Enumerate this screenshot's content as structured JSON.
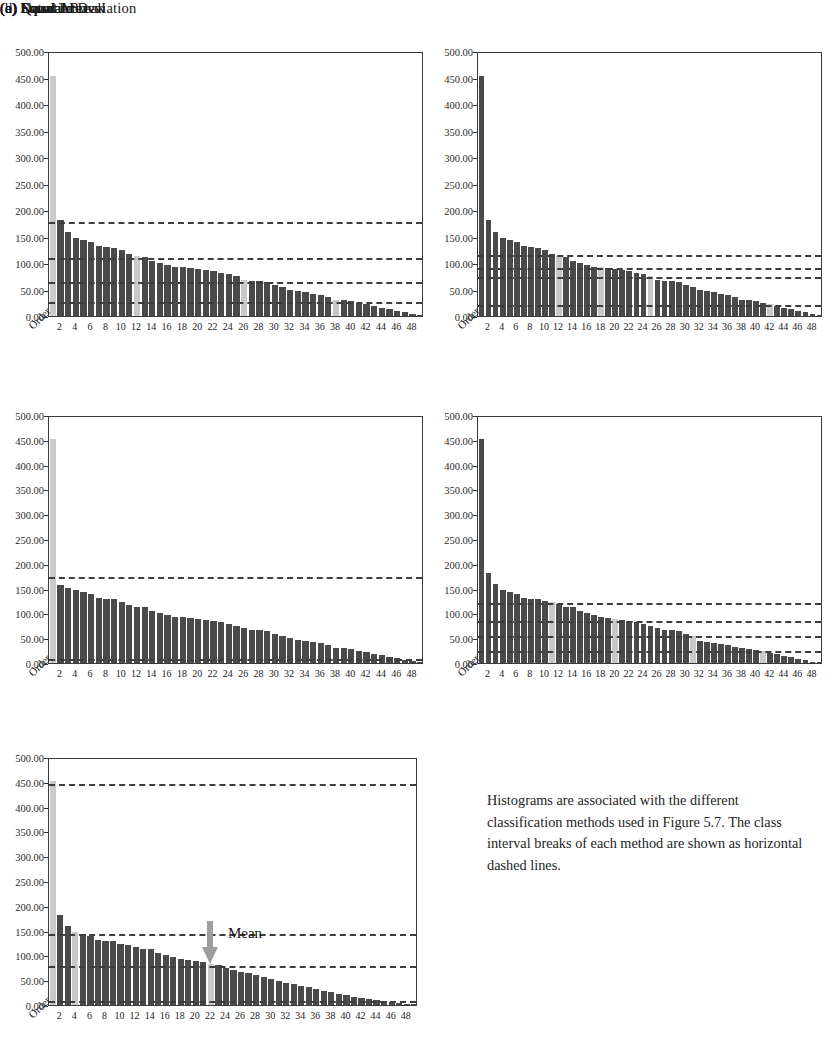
{
  "figure": {
    "caption": "Histograms are associated with the different classification methods used in Figure 5.7. The class interval breaks of each method are shown as horizontal dashed lines.",
    "mean_label": "Mean",
    "order_axis_label": "Order",
    "colors": {
      "bar": "#4a4a4a",
      "bar_highlight": "#c9c9c9",
      "dash_line": "#3d3d3d",
      "arrow": "#9e9e9e",
      "axis": "#3a3a3a",
      "background": "#ffffff"
    }
  },
  "chart_data": [
    {
      "type": "bar",
      "id": "natural-break",
      "title": "(a) Natural Break",
      "xlabel": "Order",
      "ylabel": "",
      "ylim": [
        0,
        500
      ],
      "ytick_labels": [
        "500.00",
        "450.00",
        "400.00",
        "350.00",
        "300.00",
        "250.00",
        "200.00",
        "150.00",
        "100.00",
        "50.00",
        "0.00"
      ],
      "ytick_values": [
        500,
        450,
        400,
        350,
        300,
        250,
        200,
        150,
        100,
        50,
        0
      ],
      "xtick_labels": [
        "2",
        "4",
        "6",
        "8",
        "10",
        "12",
        "14",
        "16",
        "18",
        "20",
        "22",
        "24",
        "26",
        "28",
        "30",
        "32",
        "34",
        "36",
        "38",
        "40",
        "42",
        "44",
        "46",
        "48"
      ],
      "xtick_values": [
        2,
        4,
        6,
        8,
        10,
        12,
        14,
        16,
        18,
        20,
        22,
        24,
        26,
        28,
        30,
        32,
        34,
        36,
        38,
        40,
        42,
        44,
        46,
        48
      ],
      "grid": false,
      "legend": "none",
      "categories": [
        1,
        2,
        3,
        4,
        5,
        6,
        7,
        8,
        9,
        10,
        11,
        12,
        13,
        14,
        15,
        16,
        17,
        18,
        19,
        20,
        21,
        22,
        23,
        24,
        25,
        26,
        27,
        28,
        29,
        30,
        31,
        32,
        33,
        34,
        35,
        36,
        37,
        38,
        39,
        40,
        41,
        42,
        43,
        44,
        45,
        46,
        47,
        48,
        49
      ],
      "values": [
        452,
        181,
        159,
        148,
        144,
        139,
        132,
        130,
        129,
        124,
        117,
        113,
        112,
        104,
        100,
        96,
        93,
        92,
        90,
        88,
        86,
        84,
        82,
        79,
        75,
        68,
        67,
        66,
        64,
        58,
        55,
        50,
        47,
        45,
        42,
        40,
        36,
        31,
        30,
        28,
        24,
        22,
        19,
        16,
        13,
        10,
        7,
        4,
        2
      ],
      "highlighted_bars": [
        1,
        12,
        26,
        38
      ],
      "class_breaks": [
        182,
        113,
        68,
        30
      ]
    },
    {
      "type": "bar",
      "id": "equal-area",
      "title": "(b) Equal Area",
      "xlabel": "Order",
      "ylabel": "",
      "ylim": [
        0,
        500
      ],
      "ytick_labels": [
        "500.00",
        "450.00",
        "400.00",
        "350.00",
        "300.00",
        "250.00",
        "200.00",
        "150.00",
        "100.00",
        "50.00",
        "0.00"
      ],
      "ytick_values": [
        500,
        450,
        400,
        350,
        300,
        250,
        200,
        150,
        100,
        50,
        0
      ],
      "xtick_labels": [
        "2",
        "4",
        "6",
        "8",
        "10",
        "12",
        "14",
        "16",
        "18",
        "20",
        "22",
        "24",
        "26",
        "28",
        "30",
        "32",
        "34",
        "36",
        "38",
        "40",
        "42",
        "44",
        "46",
        "48"
      ],
      "xtick_values": [
        2,
        4,
        6,
        8,
        10,
        12,
        14,
        16,
        18,
        20,
        22,
        24,
        26,
        28,
        30,
        32,
        34,
        36,
        38,
        40,
        42,
        44,
        46,
        48
      ],
      "grid": false,
      "legend": "none",
      "categories": [
        1,
        2,
        3,
        4,
        5,
        6,
        7,
        8,
        9,
        10,
        11,
        12,
        13,
        14,
        15,
        16,
        17,
        18,
        19,
        20,
        21,
        22,
        23,
        24,
        25,
        26,
        27,
        28,
        29,
        30,
        31,
        32,
        33,
        34,
        35,
        36,
        37,
        38,
        39,
        40,
        41,
        42,
        43,
        44,
        45,
        46,
        47,
        48,
        49
      ],
      "values": [
        452,
        181,
        159,
        148,
        144,
        139,
        132,
        130,
        129,
        124,
        117,
        113,
        112,
        104,
        100,
        96,
        93,
        92,
        90,
        88,
        86,
        84,
        82,
        79,
        75,
        68,
        67,
        66,
        64,
        58,
        55,
        50,
        47,
        45,
        42,
        40,
        36,
        31,
        30,
        28,
        24,
        22,
        19,
        16,
        13,
        10,
        7,
        4,
        2
      ],
      "highlighted_bars": [
        12,
        18,
        25,
        42
      ],
      "class_breaks": [
        118,
        95,
        78,
        25
      ]
    },
    {
      "type": "bar",
      "id": "equal-interval",
      "title": "(c) Equal Interval",
      "xlabel": "Order",
      "ylabel": "",
      "ylim": [
        0,
        500
      ],
      "ytick_labels": [
        "500.00",
        "450.00",
        "400.00",
        "350.00",
        "300.00",
        "250.00",
        "200.00",
        "150.00",
        "100.00",
        "50.00",
        "0.00"
      ],
      "ytick_values": [
        500,
        450,
        400,
        350,
        300,
        250,
        200,
        150,
        100,
        50,
        0
      ],
      "xtick_labels": [
        "2",
        "4",
        "6",
        "8",
        "10",
        "12",
        "14",
        "16",
        "18",
        "20",
        "22",
        "24",
        "26",
        "28",
        "30",
        "32",
        "34",
        "36",
        "38",
        "40",
        "42",
        "44",
        "46",
        "48"
      ],
      "xtick_values": [
        2,
        4,
        6,
        8,
        10,
        12,
        14,
        16,
        18,
        20,
        22,
        24,
        26,
        28,
        30,
        32,
        34,
        36,
        38,
        40,
        42,
        44,
        46,
        48
      ],
      "grid": false,
      "legend": "none",
      "categories": [
        1,
        2,
        3,
        4,
        5,
        6,
        7,
        8,
        9,
        10,
        11,
        12,
        13,
        14,
        15,
        16,
        17,
        18,
        19,
        20,
        21,
        22,
        23,
        24,
        25,
        26,
        27,
        28,
        29,
        30,
        31,
        32,
        33,
        34,
        35,
        36,
        37,
        38,
        39,
        40,
        41,
        42,
        43,
        44,
        45,
        46,
        47,
        48,
        49
      ],
      "values": [
        452,
        158,
        152,
        148,
        144,
        139,
        132,
        130,
        129,
        124,
        117,
        113,
        112,
        104,
        100,
        96,
        93,
        92,
        90,
        88,
        86,
        84,
        82,
        79,
        75,
        70,
        67,
        66,
        64,
        58,
        55,
        50,
        47,
        45,
        42,
        40,
        36,
        31,
        30,
        28,
        24,
        22,
        19,
        16,
        13,
        10,
        7,
        4,
        2
      ],
      "highlighted_bars": [
        1
      ],
      "class_breaks": [
        177,
        12
      ]
    },
    {
      "type": "bar",
      "id": "quantile",
      "title": "(d) Quantile",
      "xlabel": "Order",
      "ylabel": "",
      "ylim": [
        0,
        500
      ],
      "ytick_labels": [
        "500.00",
        "450.00",
        "400.00",
        "350.00",
        "300.00",
        "250.00",
        "200.00",
        "150.00",
        "100.00",
        "50.00",
        "0.00"
      ],
      "ytick_values": [
        500,
        450,
        400,
        350,
        300,
        250,
        200,
        150,
        100,
        50,
        0
      ],
      "xtick_labels": [
        "2",
        "4",
        "6",
        "8",
        "10",
        "12",
        "14",
        "16",
        "18",
        "20",
        "22",
        "24",
        "26",
        "28",
        "30",
        "32",
        "34",
        "36",
        "38",
        "40",
        "42",
        "44",
        "46",
        "48"
      ],
      "xtick_values": [
        2,
        4,
        6,
        8,
        10,
        12,
        14,
        16,
        18,
        20,
        22,
        24,
        26,
        28,
        30,
        32,
        34,
        36,
        38,
        40,
        42,
        44,
        46,
        48
      ],
      "grid": false,
      "legend": "none",
      "categories": [
        1,
        2,
        3,
        4,
        5,
        6,
        7,
        8,
        9,
        10,
        11,
        12,
        13,
        14,
        15,
        16,
        17,
        18,
        19,
        20,
        21,
        22,
        23,
        24,
        25,
        26,
        27,
        28,
        29,
        30,
        31,
        32,
        33,
        34,
        35,
        36,
        37,
        38,
        39,
        40,
        41,
        42,
        43,
        44,
        45,
        46,
        47,
        48,
        49
      ],
      "values": [
        452,
        181,
        159,
        148,
        144,
        139,
        132,
        130,
        129,
        126,
        124,
        119,
        113,
        112,
        104,
        100,
        96,
        93,
        90,
        88,
        86,
        84,
        82,
        79,
        75,
        70,
        67,
        66,
        64,
        58,
        55,
        44,
        42,
        41,
        39,
        36,
        33,
        30,
        28,
        26,
        24,
        20,
        18,
        15,
        12,
        9,
        6,
        3,
        1
      ],
      "highlighted_bars": [
        11,
        20,
        31,
        41
      ],
      "class_breaks": [
        125,
        88,
        58,
        28
      ]
    },
    {
      "type": "bar",
      "id": "standard-deviation",
      "title": "(e) Standard Deviation",
      "xlabel": "Order",
      "ylabel": "",
      "ylim": [
        0,
        500
      ],
      "ytick_labels": [
        "500.00",
        "450.00",
        "400.00",
        "350.00",
        "300.00",
        "250.00",
        "200.00",
        "150.00",
        "100.00",
        "50.00",
        "0.00"
      ],
      "ytick_values": [
        500,
        450,
        400,
        350,
        300,
        250,
        200,
        150,
        100,
        50,
        0
      ],
      "xtick_labels": [
        "2",
        "4",
        "6",
        "8",
        "10",
        "12",
        "14",
        "16",
        "18",
        "20",
        "22",
        "24",
        "26",
        "28",
        "30",
        "32",
        "34",
        "36",
        "38",
        "40",
        "42",
        "44",
        "46",
        "48"
      ],
      "xtick_values": [
        2,
        4,
        6,
        8,
        10,
        12,
        14,
        16,
        18,
        20,
        22,
        24,
        26,
        28,
        30,
        32,
        34,
        36,
        38,
        40,
        42,
        44,
        46,
        48
      ],
      "grid": false,
      "legend": "none",
      "categories": [
        1,
        2,
        3,
        4,
        5,
        6,
        7,
        8,
        9,
        10,
        11,
        12,
        13,
        14,
        15,
        16,
        17,
        18,
        19,
        20,
        21,
        22,
        23,
        24,
        25,
        26,
        27,
        28,
        29,
        30,
        31,
        32,
        33,
        34,
        35,
        36,
        37,
        38,
        39,
        40,
        41,
        42,
        43,
        44,
        45,
        46,
        47,
        48,
        49
      ],
      "values": [
        452,
        181,
        159,
        148,
        144,
        139,
        132,
        130,
        129,
        124,
        120,
        117,
        113,
        112,
        104,
        100,
        96,
        93,
        90,
        88,
        86,
        82,
        80,
        75,
        70,
        67,
        64,
        60,
        56,
        52,
        48,
        45,
        42,
        39,
        36,
        32,
        29,
        26,
        23,
        20,
        17,
        15,
        12,
        10,
        8,
        6,
        4,
        2,
        1
      ],
      "highlighted_bars": [
        1,
        4,
        22
      ],
      "class_breaks": [
        450,
        148,
        82,
        12
      ],
      "annotation": {
        "label": "Mean",
        "at_bar": 22,
        "value": 82
      }
    }
  ]
}
